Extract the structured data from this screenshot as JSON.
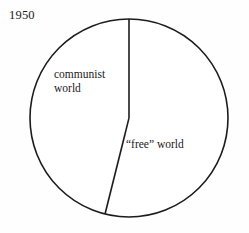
{
  "figure": {
    "width": 249,
    "height": 233,
    "background_color": "#fefefe",
    "stroke_color": "#1c1c1c",
    "year_label": "1950"
  },
  "chart_data": {
    "type": "pie",
    "title": "1950",
    "xlabel": "",
    "ylabel": "",
    "legend_position": "none",
    "grid": false,
    "labels_inline": true,
    "center": {
      "x": 129,
      "y": 118
    },
    "radius": 99,
    "start_angle_deg": 0,
    "direction": "counterclockwise",
    "categories": [
      "communist world",
      "“free” world"
    ],
    "values": [
      46,
      54
    ],
    "slices": [
      {
        "name": "communist world",
        "label_line_1": "communist",
        "label_line_2": "world",
        "value": 46,
        "angle_deg": 166,
        "from_deg": 194,
        "to_deg": 360,
        "fill": "#ffffff",
        "stroke": "#1c1c1c"
      },
      {
        "name": "“free” world",
        "label_line_1": "“free” world",
        "label_line_2": "",
        "value": 54,
        "angle_deg": 194,
        "from_deg": 0,
        "to_deg": 194,
        "fill": "#ffffff",
        "stroke": "#1c1c1c"
      }
    ]
  },
  "labels": {
    "communist_line1": "communist",
    "communist_line2": "world",
    "free_world": "“free” world"
  }
}
